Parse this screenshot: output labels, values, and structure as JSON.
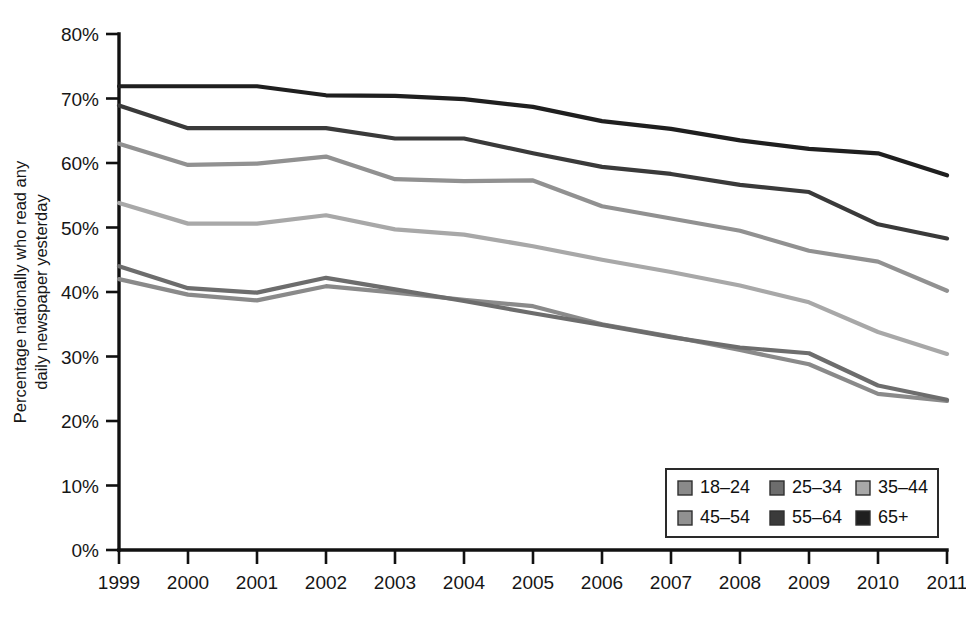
{
  "chart_data": {
    "type": "line",
    "title": "",
    "xlabel": "",
    "ylabel": "Percentage nationally who read any daily newspaper yesterday",
    "ylabel_line1": "Percentage nationally who read any",
    "ylabel_line2": "daily newspaper yesterday",
    "x": [
      1999,
      2000,
      2001,
      2002,
      2003,
      2004,
      2005,
      2006,
      2007,
      2008,
      2009,
      2010,
      2011
    ],
    "x_tick_labels": [
      "1999",
      "2000",
      "2001",
      "2002",
      "2003",
      "2004",
      "2005",
      "2006",
      "2007",
      "2008",
      "2009",
      "2010",
      "2011"
    ],
    "y_tick_labels": [
      "80%",
      "70%",
      "60%",
      "50%",
      "40%",
      "30%",
      "20%",
      "10%",
      "0%"
    ],
    "y_tick_values": [
      80,
      70,
      60,
      50,
      40,
      30,
      20,
      10,
      0
    ],
    "ylim": [
      0,
      80
    ],
    "xlim": [
      1999,
      2011
    ],
    "grid": false,
    "legend_position": "bottom-right",
    "series": [
      {
        "name": "18-24",
        "color": "#8a8a8a",
        "values": [
          42.0,
          39.6,
          38.7,
          40.9,
          39.9,
          38.8,
          37.8,
          35.0,
          33.1,
          31.0,
          28.8,
          24.2,
          23.1
        ]
      },
      {
        "name": "25-34",
        "color": "#6d6d6d",
        "values": [
          44.0,
          40.6,
          39.9,
          42.2,
          40.4,
          38.6,
          36.7,
          34.9,
          33.0,
          31.4,
          30.5,
          25.5,
          23.3
        ]
      },
      {
        "name": "35-44",
        "color": "#a8a8a8",
        "values": [
          53.8,
          50.6,
          50.6,
          51.9,
          49.7,
          48.9,
          47.1,
          45.0,
          43.1,
          41.0,
          38.4,
          33.8,
          30.4
        ]
      },
      {
        "name": "45-54",
        "color": "#919191",
        "values": [
          63.0,
          59.7,
          59.9,
          61.0,
          57.5,
          57.2,
          57.3,
          53.3,
          51.4,
          49.5,
          46.4,
          44.7,
          40.2
        ]
      },
      {
        "name": "55-64",
        "color": "#3a3a3a",
        "values": [
          68.9,
          65.4,
          65.4,
          65.4,
          63.8,
          63.8,
          61.5,
          59.4,
          58.3,
          56.6,
          55.5,
          50.5,
          48.3
        ]
      },
      {
        "name": "65+",
        "color": "#1f1f1f",
        "values": [
          71.9,
          71.9,
          71.9,
          70.5,
          70.4,
          69.9,
          68.7,
          66.5,
          65.3,
          63.5,
          62.2,
          61.5,
          58.1
        ]
      }
    ],
    "legend_entries": [
      {
        "label": "18-24",
        "color": "#8a8a8a"
      },
      {
        "label": "25-34",
        "color": "#6d6d6d"
      },
      {
        "label": "35-44",
        "color": "#a8a8a8"
      },
      {
        "label": "45-54",
        "color": "#919191"
      },
      {
        "label": "55-64",
        "color": "#3a3a3a"
      },
      {
        "label": "65+",
        "color": "#1f1f1f"
      }
    ]
  },
  "colors": {
    "background": "#ffffff",
    "axis": "#111111",
    "text": "#161616",
    "legend_border": "#2a2a2a"
  }
}
